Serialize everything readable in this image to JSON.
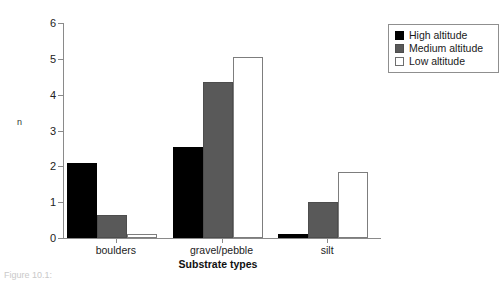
{
  "chart_data": {
    "type": "bar",
    "title": "",
    "xlabel": "Substrate types",
    "ylabel": "n",
    "categories": [
      "boulders",
      "gravel/pebble",
      "silt"
    ],
    "ylim": [
      0,
      6
    ],
    "yticks": [
      0,
      1,
      2,
      3,
      4,
      5,
      6
    ],
    "ytick_labels": [
      "0",
      "1",
      "2",
      "3",
      "4",
      "5",
      "6"
    ],
    "grid": false,
    "legend_position": "top-right",
    "series": [
      {
        "name": "High altitude",
        "color": "#000000",
        "values": [
          2.1,
          2.55,
          0.1
        ]
      },
      {
        "name": "Medium altitude",
        "color": "#595959",
        "values": [
          0.65,
          4.35,
          1.0
        ]
      },
      {
        "name": "Low altitude",
        "color": "#ffffff",
        "values": [
          0.1,
          5.05,
          1.85
        ]
      }
    ]
  },
  "legend": {
    "items": [
      {
        "label": "High altitude"
      },
      {
        "label": "Medium altitude"
      },
      {
        "label": "Low altitude"
      }
    ]
  },
  "caption": {
    "text": "Figure 10.1:"
  }
}
